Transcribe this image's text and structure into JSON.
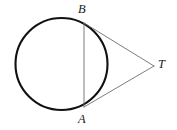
{
  "figure": {
    "kind": "geometry-diagram",
    "canvas": {
      "width": 177,
      "height": 130,
      "background": "#ffffff"
    },
    "colors": {
      "circle_stroke": "#111111",
      "chord_stroke": "#6e6e6e",
      "tangent_stroke": "#6e6e6e",
      "label_color": "#1a1a1a",
      "background": "#ffffff"
    },
    "circle": {
      "name": "circle",
      "center_x": 61.5,
      "center_y": 64,
      "radius": 46,
      "stroke_width": 2.1
    },
    "points": [
      {
        "id": "B",
        "label": "B",
        "x": 84,
        "y": 23,
        "label_x": 78,
        "label_y": 3
      },
      {
        "id": "A",
        "label": "A",
        "x": 84,
        "y": 107,
        "label_x": 78,
        "label_y": 113
      },
      {
        "id": "T",
        "label": "T",
        "x": 154,
        "y": 66,
        "label_x": 158,
        "label_y": 58
      }
    ],
    "segments": [
      {
        "id": "chord-AB",
        "from": "B",
        "to": "A",
        "x1": 84,
        "y1": 23,
        "x2": 84,
        "y2": 107,
        "stroke_width": 0.9
      },
      {
        "id": "segment-BT",
        "from": "B",
        "to": "T",
        "x1": 84,
        "y1": 23,
        "x2": 154,
        "y2": 66,
        "stroke_width": 0.9
      },
      {
        "id": "segment-AT",
        "from": "A",
        "to": "T",
        "x1": 84,
        "y1": 107,
        "x2": 154,
        "y2": 66,
        "stroke_width": 0.9
      }
    ],
    "labels": {
      "B": "B",
      "A": "A",
      "T": "T"
    }
  }
}
